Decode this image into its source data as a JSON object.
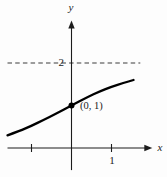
{
  "figure": {
    "background": "#fdfdfd"
  },
  "labels": {
    "y_axis": "y",
    "x_axis": "x",
    "asymptote_value": "2",
    "x_tick_one": "1",
    "point": "(0, 1)"
  },
  "colors": {
    "ink": "#1c1c1c",
    "curve": "#000000",
    "dash": "#3d3d3d",
    "background": "#fdfdfd"
  },
  "chart_data": {
    "type": "line",
    "title": "",
    "xlabel": "x",
    "ylabel": "y",
    "grid": false,
    "legend": false,
    "x_axis_range": [
      -1.6,
      2.02
    ],
    "y_axis_range": [
      -0.52,
      3.0
    ],
    "x_ticks": [
      -1,
      1
    ],
    "x_tick_labels": [
      "",
      "1"
    ],
    "y_ticks": [
      2
    ],
    "y_tick_labels": [
      "2"
    ],
    "horizontal_asymptote": {
      "y": 2,
      "style": "dashed",
      "x_range": [
        -1.6,
        1.72
      ],
      "label": "2"
    },
    "marked_point": {
      "x": 0,
      "y": 1,
      "label": "(0, 1)",
      "marker": "filled-dot"
    },
    "series": [
      {
        "name": "increasing-curve",
        "points": [
          [
            -1.6,
            0.3
          ],
          [
            -1.3,
            0.4
          ],
          [
            -1.0,
            0.52
          ],
          [
            -0.7,
            0.66
          ],
          [
            -0.4,
            0.8
          ],
          [
            0.0,
            1.0
          ],
          [
            0.4,
            1.2
          ],
          [
            0.7,
            1.33
          ],
          [
            1.0,
            1.44
          ],
          [
            1.3,
            1.53
          ],
          [
            1.55,
            1.6
          ]
        ]
      }
    ]
  }
}
